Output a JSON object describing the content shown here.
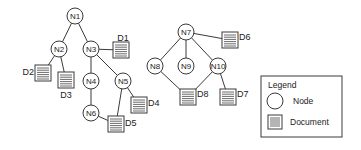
{
  "diagram": {
    "nodes": [
      {
        "id": "N1",
        "label": "N1"
      },
      {
        "id": "N2",
        "label": "N2"
      },
      {
        "id": "N3",
        "label": "N3"
      },
      {
        "id": "N4",
        "label": "N4"
      },
      {
        "id": "N5",
        "label": "N5"
      },
      {
        "id": "N6",
        "label": "N6"
      },
      {
        "id": "N7",
        "label": "N7"
      },
      {
        "id": "N8",
        "label": "N8"
      },
      {
        "id": "N9",
        "label": "N9"
      },
      {
        "id": "N10",
        "label": "N10"
      }
    ],
    "documents": [
      {
        "id": "D1",
        "label": "D1"
      },
      {
        "id": "D2",
        "label": "D2"
      },
      {
        "id": "D3",
        "label": "D3"
      },
      {
        "id": "D4",
        "label": "D4"
      },
      {
        "id": "D5",
        "label": "D5"
      },
      {
        "id": "D6",
        "label": "D6"
      },
      {
        "id": "D7",
        "label": "D7"
      },
      {
        "id": "D8",
        "label": "D8"
      }
    ],
    "edges": [
      [
        "N1",
        "N2"
      ],
      [
        "N1",
        "N3"
      ],
      [
        "N2",
        "D2"
      ],
      [
        "N2",
        "D3"
      ],
      [
        "N3",
        "D1"
      ],
      [
        "N3",
        "N4"
      ],
      [
        "N3",
        "N5"
      ],
      [
        "N4",
        "N6"
      ],
      [
        "N5",
        "D4"
      ],
      [
        "N5",
        "D5"
      ],
      [
        "N6",
        "D5"
      ],
      [
        "N7",
        "N8"
      ],
      [
        "N7",
        "N9"
      ],
      [
        "N7",
        "N10"
      ],
      [
        "N7",
        "D6"
      ],
      [
        "N8",
        "D8"
      ],
      [
        "N10",
        "D8"
      ],
      [
        "N10",
        "D7"
      ]
    ]
  },
  "legend": {
    "title": "Legend",
    "node_label": "Node",
    "document_label": "Document"
  }
}
